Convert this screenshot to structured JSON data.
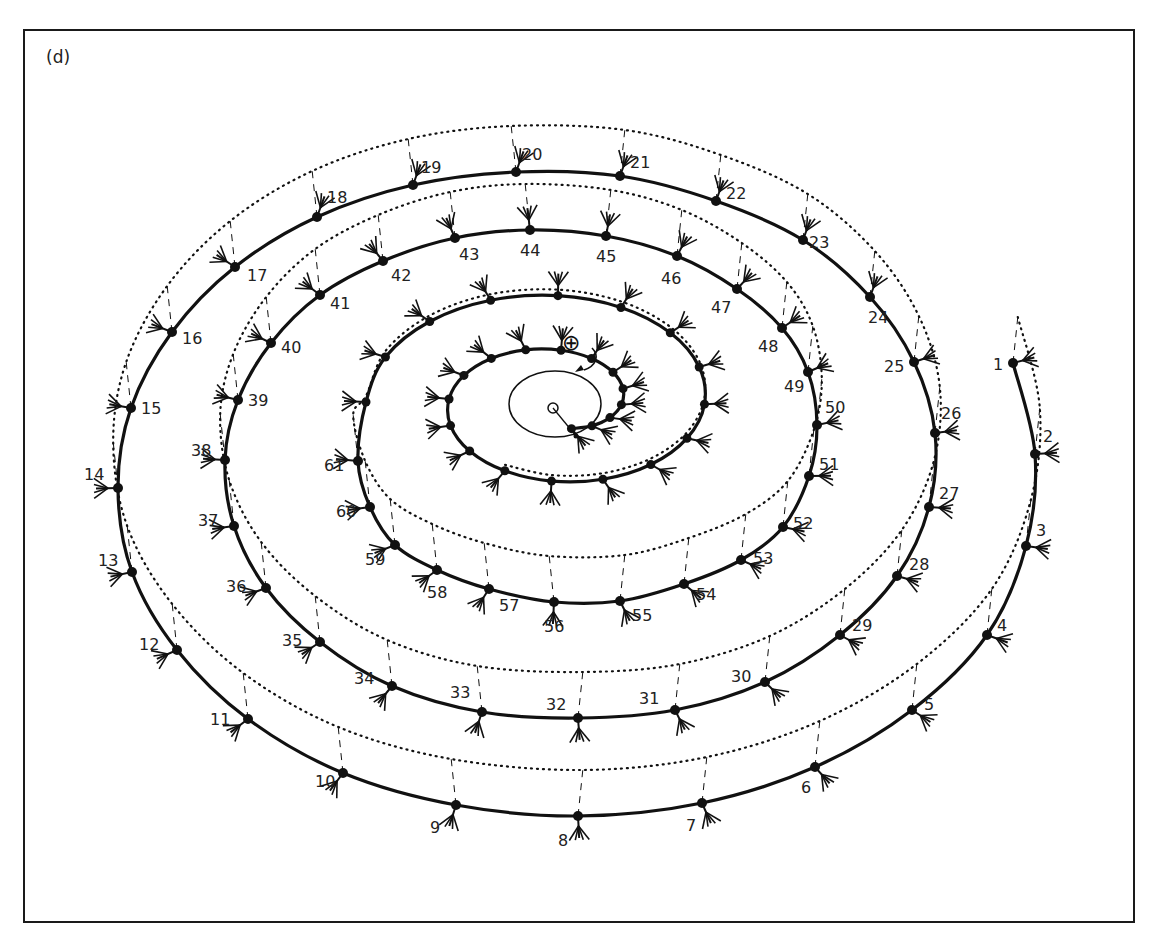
{
  "panel_label": "(d)",
  "colors": {
    "ink": "#111111",
    "paper": "#ffffff"
  },
  "center_marker": {
    "symbol": "⊕",
    "description": "circled plus marker with curved arrow pointing to spiral start"
  },
  "diagram": {
    "type": "3D descending spiral with numbered stations",
    "station_count": 61,
    "inner_unlabeled_nodes": 28,
    "stations": [
      {
        "n": 1,
        "label": "1"
      },
      {
        "n": 2,
        "label": "2"
      },
      {
        "n": 3,
        "label": "3"
      },
      {
        "n": 4,
        "label": "4"
      },
      {
        "n": 5,
        "label": "5"
      },
      {
        "n": 6,
        "label": "6"
      },
      {
        "n": 7,
        "label": "7"
      },
      {
        "n": 8,
        "label": "8"
      },
      {
        "n": 9,
        "label": "9"
      },
      {
        "n": 10,
        "label": "10"
      },
      {
        "n": 11,
        "label": "11"
      },
      {
        "n": 12,
        "label": "12"
      },
      {
        "n": 13,
        "label": "13"
      },
      {
        "n": 14,
        "label": "14"
      },
      {
        "n": 15,
        "label": "15"
      },
      {
        "n": 16,
        "label": "16"
      },
      {
        "n": 17,
        "label": "17"
      },
      {
        "n": 18,
        "label": "18"
      },
      {
        "n": 19,
        "label": "19"
      },
      {
        "n": 20,
        "label": "20"
      },
      {
        "n": 21,
        "label": "21"
      },
      {
        "n": 22,
        "label": "22"
      },
      {
        "n": 23,
        "label": "23"
      },
      {
        "n": 24,
        "label": "24"
      },
      {
        "n": 25,
        "label": "25"
      },
      {
        "n": 26,
        "label": "26"
      },
      {
        "n": 27,
        "label": "27"
      },
      {
        "n": 28,
        "label": "28"
      },
      {
        "n": 29,
        "label": "29"
      },
      {
        "n": 30,
        "label": "30"
      },
      {
        "n": 31,
        "label": "31"
      },
      {
        "n": 32,
        "label": "32"
      },
      {
        "n": 33,
        "label": "33"
      },
      {
        "n": 34,
        "label": "34"
      },
      {
        "n": 35,
        "label": "35"
      },
      {
        "n": 36,
        "label": "36"
      },
      {
        "n": 37,
        "label": "37"
      },
      {
        "n": 38,
        "label": "38"
      },
      {
        "n": 39,
        "label": "39"
      },
      {
        "n": 40,
        "label": "40"
      },
      {
        "n": 41,
        "label": "41"
      },
      {
        "n": 42,
        "label": "42"
      },
      {
        "n": 43,
        "label": "43"
      },
      {
        "n": 44,
        "label": "44"
      },
      {
        "n": 45,
        "label": "45"
      },
      {
        "n": 46,
        "label": "46"
      },
      {
        "n": 47,
        "label": "47"
      },
      {
        "n": 48,
        "label": "48"
      },
      {
        "n": 49,
        "label": "49"
      },
      {
        "n": 50,
        "label": "50"
      },
      {
        "n": 51,
        "label": "51"
      },
      {
        "n": 52,
        "label": "52"
      },
      {
        "n": 53,
        "label": "53"
      },
      {
        "n": 54,
        "label": "54"
      },
      {
        "n": 55,
        "label": "55"
      },
      {
        "n": 56,
        "label": "56"
      },
      {
        "n": 57,
        "label": "57"
      },
      {
        "n": 58,
        "label": "58"
      },
      {
        "n": 59,
        "label": "59"
      },
      {
        "n": 60,
        "label": "60"
      },
      {
        "n": 61,
        "label": "61"
      }
    ]
  }
}
